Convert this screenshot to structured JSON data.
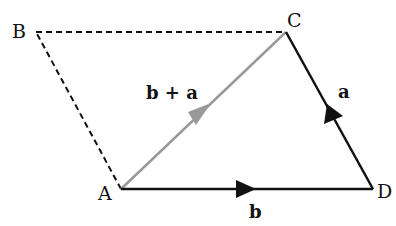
{
  "diagram": {
    "title": "",
    "points": {
      "A": {
        "label": "A",
        "x": 121,
        "y": 189
      },
      "B": {
        "label": "B",
        "x": 36,
        "y": 32
      },
      "C": {
        "label": "C",
        "x": 286,
        "y": 32
      },
      "D": {
        "label": "D",
        "x": 373,
        "y": 189
      }
    },
    "vectors": [
      {
        "id": "b",
        "label": "b",
        "from": "A",
        "to": "D",
        "color": "#111111",
        "style": "solid"
      },
      {
        "id": "a",
        "label": "a",
        "from": "D",
        "to": "C",
        "color": "#111111",
        "style": "solid"
      },
      {
        "id": "b_plus_a",
        "label": "b + a",
        "from": "A",
        "to": "C",
        "color": "#999999",
        "style": "solid"
      }
    ],
    "dashed_edges": [
      {
        "from": "A",
        "to": "B"
      },
      {
        "from": "B",
        "to": "C"
      }
    ],
    "labels": {
      "A": "A",
      "B": "B",
      "C": "C",
      "D": "D",
      "vec_b": "b",
      "vec_a": "a",
      "vec_sum": "b + a"
    }
  }
}
